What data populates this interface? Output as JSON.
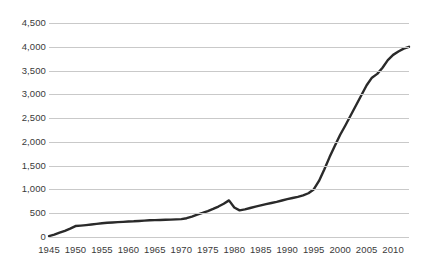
{
  "chart_data": {
    "type": "line",
    "title": "",
    "subtitle": "",
    "xlabel": "",
    "ylabel": "",
    "xlim": [
      1945,
      2013
    ],
    "ylim": [
      0,
      4500
    ],
    "grid": true,
    "legend": null,
    "legend_position": "none",
    "line_color": "#2a2a2a",
    "grid_color": "#c9c9c9",
    "background": "#ffffff",
    "ytick_labels": [
      "4,500",
      "4,000",
      "3,500",
      "3,000",
      "2,500",
      "2,000",
      "1,500",
      "1,000",
      "500",
      "0"
    ],
    "ytick_values": [
      4500,
      4000,
      3500,
      3000,
      2500,
      2000,
      1500,
      1000,
      500,
      0
    ],
    "xtick_labels": [
      "1945",
      "1950",
      "1955",
      "1960",
      "1965",
      "1970",
      "1975",
      "1980",
      "1985",
      "1990",
      "1995",
      "2000",
      "2005",
      "2010"
    ],
    "xtick_values": [
      1945,
      1950,
      1955,
      1960,
      1965,
      1970,
      1975,
      1980,
      1985,
      1990,
      1995,
      2000,
      2005,
      2010
    ],
    "series": [
      {
        "name": "value",
        "x": [
          1945,
          1946,
          1947,
          1948,
          1949,
          1950,
          1951,
          1952,
          1953,
          1954,
          1955,
          1956,
          1957,
          1958,
          1959,
          1960,
          1961,
          1962,
          1963,
          1964,
          1965,
          1966,
          1967,
          1968,
          1969,
          1970,
          1971,
          1972,
          1973,
          1974,
          1975,
          1976,
          1977,
          1978,
          1979,
          1980,
          1981,
          1982,
          1983,
          1984,
          1985,
          1986,
          1987,
          1988,
          1989,
          1990,
          1991,
          1992,
          1993,
          1994,
          1995,
          1996,
          1997,
          1998,
          1999,
          2000,
          2001,
          2002,
          2003,
          2004,
          2005,
          2006,
          2007,
          2008,
          2009,
          2010,
          2011,
          2012,
          2013
        ],
        "values": [
          20,
          50,
          90,
          130,
          175,
          230,
          240,
          250,
          262,
          275,
          290,
          300,
          305,
          312,
          318,
          325,
          330,
          338,
          345,
          352,
          355,
          358,
          362,
          366,
          370,
          375,
          395,
          430,
          470,
          505,
          545,
          590,
          640,
          700,
          770,
          620,
          560,
          580,
          610,
          640,
          665,
          690,
          715,
          740,
          768,
          795,
          820,
          845,
          875,
          920,
          1000,
          1180,
          1420,
          1680,
          1920,
          2150,
          2350,
          2560,
          2770,
          2980,
          3190,
          3350,
          3430,
          3560,
          3720,
          3830,
          3900,
          3960,
          4000
        ]
      }
    ]
  }
}
